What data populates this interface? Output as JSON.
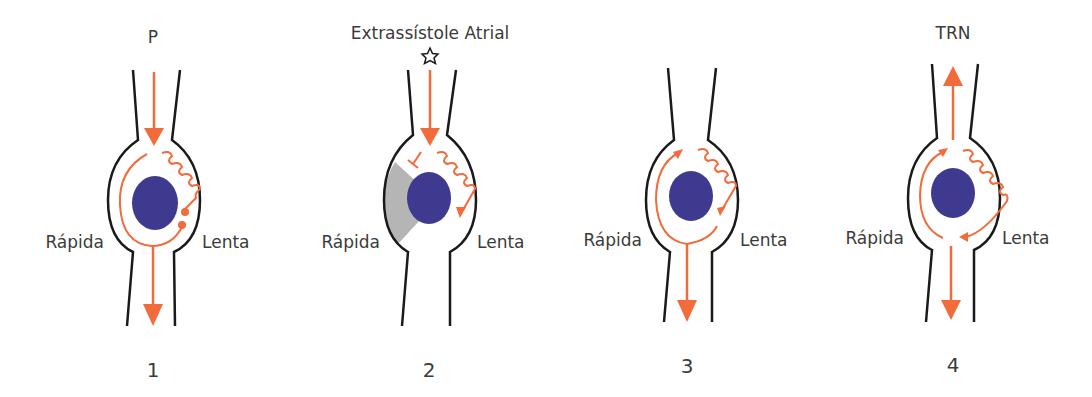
{
  "colors": {
    "pathway": "#f26b3a",
    "node": "#3d3a8f",
    "outline": "#1a1a1a",
    "refractory": "#b5b5b5",
    "text": "#3b3b3b"
  },
  "panels": [
    {
      "number": "1",
      "title": "P",
      "left_label": "Rápida",
      "right_label": "Lenta"
    },
    {
      "number": "2",
      "title": "Extrassístole Atrial",
      "left_label": "Rápida",
      "right_label": "Lenta",
      "marker": "star-icon"
    },
    {
      "number": "3",
      "title": "",
      "left_label": "Rápida",
      "right_label": "Lenta"
    },
    {
      "number": "4",
      "title": "TRN",
      "left_label": "Rápida",
      "right_label": "Lenta"
    }
  ]
}
